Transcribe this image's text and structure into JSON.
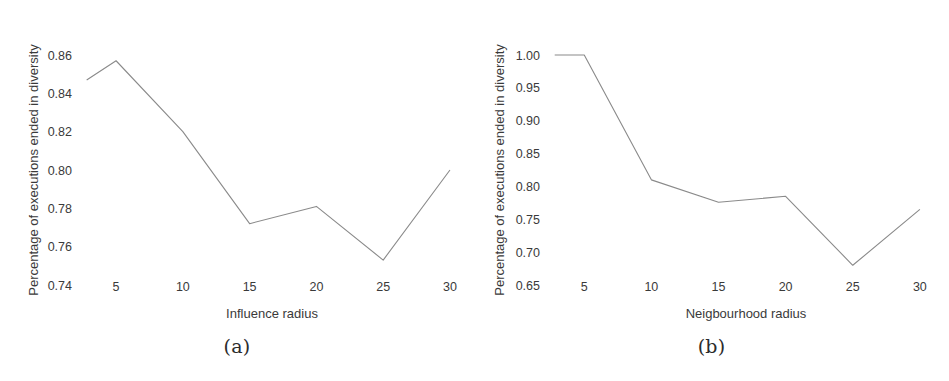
{
  "figure": {
    "background": "#ffffff",
    "line_color": "#8a8a8a",
    "text_color": "#3a3a3a"
  },
  "subfigures": [
    {
      "caption": "(a)",
      "chart_data": {
        "type": "line",
        "title": "",
        "xlabel": "Influence radius",
        "ylabel": "Percentage of executions ended in diversity",
        "x": [
          5,
          10,
          15,
          20,
          25,
          30
        ],
        "values": [
          0.857,
          0.82,
          0.772,
          0.781,
          0.753,
          0.8
        ],
        "lead_in_point": {
          "x": 2.8,
          "y": 0.847
        },
        "xticks": [
          "5",
          "10",
          "15",
          "20",
          "25",
          "30"
        ],
        "xtick_values": [
          5,
          10,
          15,
          20,
          25,
          30
        ],
        "yticks": [
          "0.74",
          "0.76",
          "0.78",
          "0.80",
          "0.82",
          "0.84",
          "0.86"
        ],
        "ytick_values": [
          0.74,
          0.76,
          0.78,
          0.8,
          0.82,
          0.84,
          0.86
        ],
        "xlim": [
          2.3,
          31.2
        ],
        "ylim": [
          0.74,
          0.86
        ],
        "grid": false,
        "legend": "none"
      }
    },
    {
      "caption": "(b)",
      "chart_data": {
        "type": "line",
        "title": "",
        "xlabel": "Neigbourhood radius",
        "ylabel": "Percentage of executions ended in diversity",
        "x": [
          5,
          10,
          15,
          20,
          25,
          30
        ],
        "values": [
          1.0,
          0.81,
          0.776,
          0.785,
          0.68,
          0.765
        ],
        "lead_in_point": {
          "x": 2.8,
          "y": 1.0
        },
        "xticks": [
          "5",
          "10",
          "15",
          "20",
          "25",
          "30"
        ],
        "xtick_values": [
          5,
          10,
          15,
          20,
          25,
          30
        ],
        "yticks": [
          "0.65",
          "0.70",
          "0.75",
          "0.80",
          "0.85",
          "0.90",
          "0.95",
          "1.00"
        ],
        "ytick_values": [
          0.65,
          0.7,
          0.75,
          0.8,
          0.85,
          0.9,
          0.95,
          1.0
        ],
        "xlim": [
          2.3,
          31.2
        ],
        "ylim": [
          0.65,
          1.0
        ],
        "grid": false,
        "legend": "none"
      }
    }
  ]
}
